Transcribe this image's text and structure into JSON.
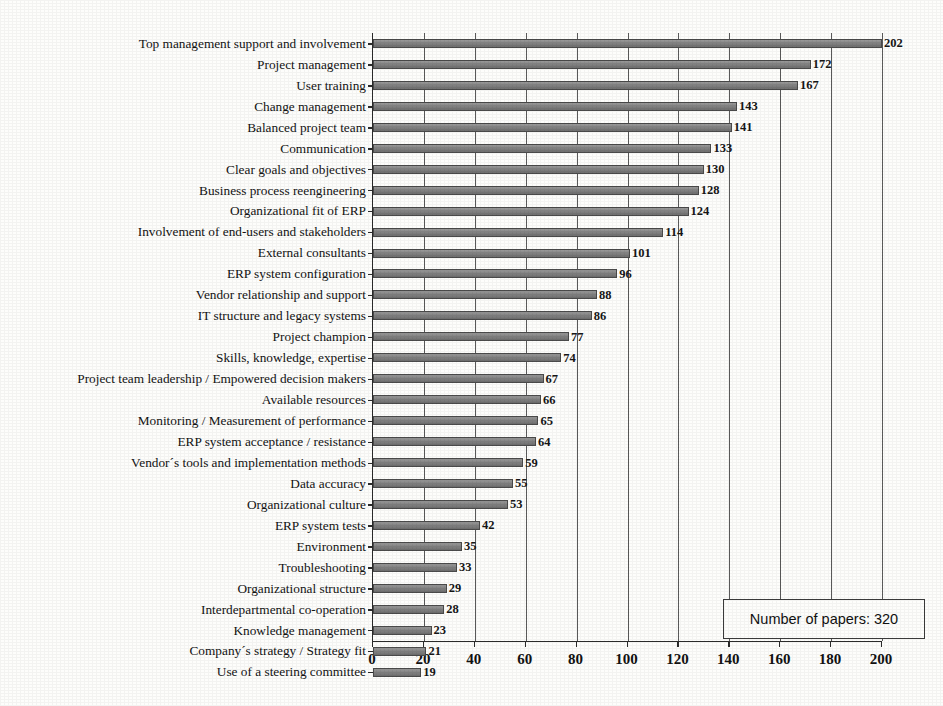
{
  "chart_data": {
    "type": "bar",
    "orientation": "horizontal",
    "title": "",
    "xlabel": "",
    "ylabel": "",
    "xlim": [
      0,
      200
    ],
    "xticks": [
      0,
      20,
      40,
      60,
      80,
      100,
      120,
      140,
      160,
      180,
      200
    ],
    "grid": true,
    "legend_position": "bottom-right",
    "annotation": "Number of papers: 320",
    "categories": [
      "Top management support and involvement",
      "Project management",
      "User training",
      "Change management",
      "Balanced project team",
      "Communication",
      "Clear goals and objectives",
      "Business process reengineering",
      "Organizational fit of ERP",
      "Involvement of end-users and stakeholders",
      "External consultants",
      "ERP system configuration",
      "Vendor relationship and support",
      "IT structure and legacy systems",
      "Project champion",
      "Skills, knowledge, expertise",
      "Project team leadership / Empowered decision makers",
      "Available resources",
      "Monitoring / Measurement of performance",
      "ERP system acceptance / resistance",
      "Vendor´s tools and implementation methods",
      "Data accuracy",
      "Organizational culture",
      "ERP system tests",
      "Environment",
      "Troubleshooting",
      "Organizational structure",
      "Interdepartmental co-operation",
      "Knowledge management",
      "Company´s strategy / Strategy fit",
      "Use of a steering committee"
    ],
    "values": [
      202,
      172,
      167,
      143,
      141,
      133,
      130,
      128,
      124,
      114,
      101,
      96,
      88,
      86,
      77,
      74,
      67,
      66,
      65,
      64,
      59,
      55,
      53,
      42,
      35,
      33,
      29,
      28,
      23,
      21,
      19
    ],
    "bar_color": "#808080",
    "bar_edge_color": "#4a4a4a"
  },
  "legend": {
    "text": "Number of papers: 320"
  }
}
